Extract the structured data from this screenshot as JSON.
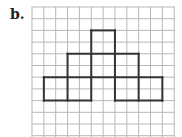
{
  "label": "b.",
  "grid": {
    "x0": 32,
    "y0": 7,
    "cols": 12,
    "rows": 11,
    "cell_w": 11.85,
    "cell_h": 11.7,
    "line_color": "#b8b8b8",
    "bold_color": "#333333"
  },
  "figure": {
    "segments": [
      [
        5,
        2,
        7,
        2
      ],
      [
        5,
        2,
        5,
        6
      ],
      [
        7,
        2,
        7,
        6
      ],
      [
        3,
        4,
        9,
        4
      ],
      [
        3,
        4,
        3,
        8
      ],
      [
        9,
        4,
        9,
        8
      ],
      [
        1,
        6,
        11,
        6
      ],
      [
        1,
        6,
        1,
        8
      ],
      [
        11,
        6,
        11,
        8
      ],
      [
        1,
        8,
        5,
        8
      ],
      [
        7,
        8,
        11,
        8
      ],
      [
        5,
        6,
        5,
        8
      ],
      [
        7,
        6,
        7,
        8
      ]
    ]
  }
}
